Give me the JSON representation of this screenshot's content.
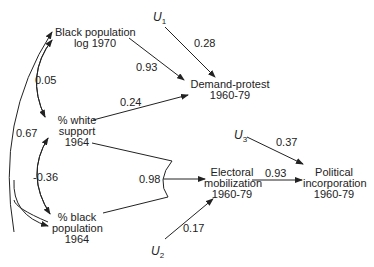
{
  "nodes": {
    "black_pop": "Black population\nlog 1970",
    "white_support": "% white\nsupport\n1964",
    "black_pct": "% black\npopulation\n1964",
    "demand_protest": "Demand-protest\n1960-79",
    "electoral": "Electoral\nmobilization\n1960-79",
    "political": "Political\nincorporation\n1960-79"
  },
  "errors": {
    "u1": "U",
    "u1_sub": "1",
    "u2": "U",
    "u2_sub": "2",
    "u3": "U",
    "u3_sub": "3"
  },
  "coefficients": {
    "u1_demand": "0.28",
    "blackpop_demand": "0.93",
    "white_demand": "0.24",
    "corr_blackpop_white": "0.05",
    "corr_blackpop_blackpct": "0.67",
    "corr_white_blackpct": "-0.36",
    "combined_electoral": "0.98",
    "electoral_political": "0.93",
    "u3_political": "0.37",
    "u2_electoral": "0.17"
  }
}
